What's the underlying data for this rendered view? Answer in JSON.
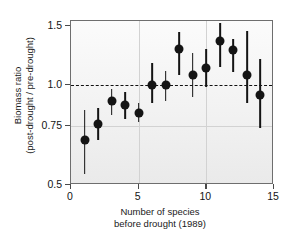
{
  "chart_data": {
    "type": "scatter",
    "title": "",
    "xlabel_line1": "Number of species",
    "xlabel_line2": "before drought (1989)",
    "ylabel_line1": "Biomass ratio",
    "ylabel_line2": "(post-drought / pre-drought)",
    "xlim": [
      0,
      15
    ],
    "ylim": [
      0.5,
      1.55
    ],
    "yscale": "log",
    "xticks": [
      0,
      5,
      10,
      15
    ],
    "xtick_labels": [
      "0",
      "5",
      "10",
      "15"
    ],
    "yticks": [
      0.5,
      0.75,
      1.0,
      1.5
    ],
    "ytick_labels": [
      "0.5",
      "0.75",
      "1.0",
      "1.5"
    ],
    "grid": "light gridlines at x=5, x=10 and y=0.75",
    "reference_line": {
      "y": 1.0,
      "style": "dashed",
      "color": "#111111"
    },
    "legend": "none",
    "errorbar_type": "vertical range (confidence interval)",
    "x": [
      1,
      2,
      3,
      4,
      5,
      6,
      7,
      8,
      9,
      10,
      11,
      12,
      13,
      14
    ],
    "values": [
      0.68,
      0.76,
      0.89,
      0.87,
      0.82,
      1.0,
      1.0,
      1.28,
      1.07,
      1.12,
      1.35,
      1.27,
      1.07,
      0.93
    ],
    "err_low": [
      0.54,
      0.68,
      0.81,
      0.79,
      0.77,
      0.88,
      0.89,
      1.07,
      0.92,
      0.98,
      1.13,
      1.09,
      0.88,
      0.74
    ],
    "err_high": [
      0.84,
      0.85,
      0.97,
      0.95,
      0.88,
      1.16,
      1.1,
      1.44,
      1.24,
      1.28,
      1.53,
      1.37,
      1.45,
      1.19
    ]
  },
  "axis_colors": {
    "frame": "#6e6e6e",
    "marker": "#141414",
    "gridline": "#d2d2d2",
    "panel_background": "#f2f2f2"
  }
}
